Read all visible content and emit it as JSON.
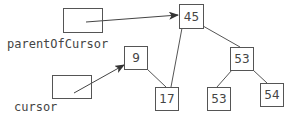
{
  "diagram": {
    "type": "binary-search-tree",
    "pointers": [
      {
        "id": "parentOfCursor",
        "label": "parentOfCursor",
        "points_to": "45"
      },
      {
        "id": "cursor",
        "label": "cursor",
        "points_to": "9"
      }
    ],
    "nodes": [
      {
        "id": "n45",
        "value": "45"
      },
      {
        "id": "n9",
        "value": "9"
      },
      {
        "id": "n17",
        "value": "17"
      },
      {
        "id": "n53",
        "value": "53"
      },
      {
        "id": "n53b",
        "value": "53"
      },
      {
        "id": "n54",
        "value": "54"
      }
    ],
    "edges": [
      {
        "from": "45",
        "to": "17"
      },
      {
        "from": "45",
        "to": "53"
      },
      {
        "from": "9",
        "to": "17"
      },
      {
        "from": "53",
        "to": "53"
      },
      {
        "from": "53",
        "to": "54"
      }
    ],
    "colors": {
      "line": "#555555",
      "text": "#444444",
      "background": "#ffffff"
    }
  }
}
